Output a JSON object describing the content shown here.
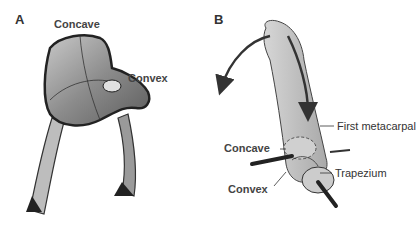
{
  "panels": [
    {
      "id": "A",
      "label": "A",
      "annotations": [
        "Concave",
        "Convex"
      ]
    },
    {
      "id": "B",
      "label": "B",
      "annotations": [
        "First metacarpal",
        "Concave",
        "Trapezium",
        "Convex"
      ]
    }
  ],
  "colors": {
    "saddle_fill": "#9a9a9a",
    "bone_fill": "#c8c8c8",
    "outline": "#333333",
    "arrow": "#333333"
  }
}
